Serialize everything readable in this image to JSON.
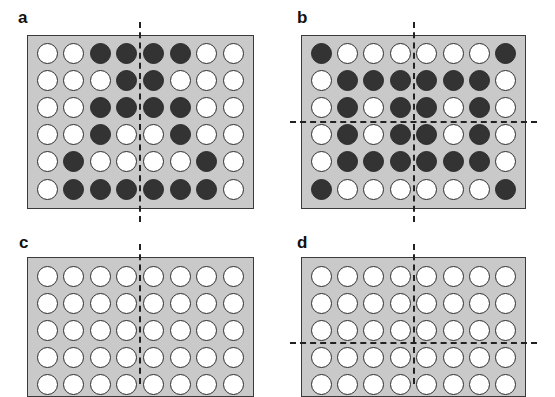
{
  "figure": {
    "panels": [
      {
        "id": "a",
        "label": "a",
        "symmetry_axes": [
          "vertical"
        ],
        "rows": 6,
        "cols": 8,
        "wells": [
          [
            0,
            0,
            1,
            1,
            1,
            1,
            0,
            0
          ],
          [
            0,
            0,
            0,
            1,
            1,
            0,
            0,
            0
          ],
          [
            0,
            0,
            1,
            1,
            1,
            1,
            0,
            0
          ],
          [
            0,
            0,
            1,
            0,
            0,
            1,
            0,
            0
          ],
          [
            0,
            1,
            0,
            0,
            0,
            0,
            1,
            0
          ],
          [
            0,
            1,
            1,
            1,
            1,
            1,
            1,
            0
          ]
        ]
      },
      {
        "id": "b",
        "label": "b",
        "symmetry_axes": [
          "vertical",
          "horizontal"
        ],
        "rows": 6,
        "cols": 8,
        "wells": [
          [
            1,
            0,
            0,
            0,
            0,
            0,
            0,
            1
          ],
          [
            0,
            1,
            1,
            1,
            1,
            1,
            1,
            0
          ],
          [
            0,
            1,
            0,
            1,
            1,
            0,
            1,
            0
          ],
          [
            0,
            1,
            0,
            1,
            1,
            0,
            1,
            0
          ],
          [
            0,
            1,
            1,
            1,
            1,
            1,
            1,
            0
          ],
          [
            1,
            0,
            0,
            0,
            0,
            0,
            0,
            1
          ]
        ]
      },
      {
        "id": "c",
        "label": "c",
        "symmetry_axes": [
          "vertical"
        ],
        "rows_visible": 5,
        "cols": 8,
        "wells": [
          [
            0,
            0,
            0,
            0,
            0,
            0,
            0,
            0
          ],
          [
            0,
            0,
            0,
            0,
            0,
            0,
            0,
            0
          ],
          [
            0,
            0,
            0,
            0,
            0,
            0,
            0,
            0
          ],
          [
            0,
            0,
            0,
            0,
            0,
            0,
            0,
            0
          ],
          [
            0,
            0,
            0,
            0,
            0,
            0,
            0,
            0
          ]
        ]
      },
      {
        "id": "d",
        "label": "d",
        "symmetry_axes": [
          "vertical",
          "horizontal"
        ],
        "rows_visible": 5,
        "cols": 8,
        "wells": [
          [
            0,
            0,
            0,
            0,
            0,
            0,
            0,
            0
          ],
          [
            0,
            0,
            0,
            0,
            0,
            0,
            0,
            0
          ],
          [
            0,
            0,
            0,
            0,
            0,
            0,
            0,
            0
          ],
          [
            0,
            0,
            0,
            0,
            0,
            0,
            0,
            0
          ],
          [
            0,
            0,
            0,
            0,
            0,
            0,
            0,
            0
          ]
        ]
      }
    ],
    "colors": {
      "plate": "#c9c9c9",
      "filled_well": "#333333",
      "empty_well": "#ffffff",
      "outline": "#2e2e2e"
    }
  }
}
